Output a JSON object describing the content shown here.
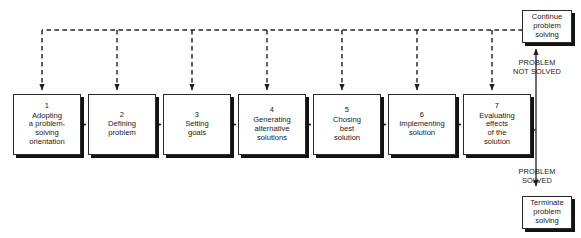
{
  "diagram": {
    "stages": [
      {
        "num": "1",
        "label": "Adopting\na problem-\nsolving\norientation",
        "x": 13
      },
      {
        "num": "2",
        "label": "Defining\nproblem",
        "x": 88
      },
      {
        "num": "3",
        "label": "Setting\ngoals",
        "x": 163
      },
      {
        "num": "4",
        "label": "Generating\nalternative\nsolutions",
        "x": 238
      },
      {
        "num": "5",
        "label": "Chosing\nbest\nsolution",
        "x": 313
      },
      {
        "num": "6",
        "label": "Implementing\nsolution",
        "x": 388
      },
      {
        "num": "7",
        "label": "Evaluating\neffects\nof the\nsolution",
        "x": 463
      }
    ],
    "outcomes": [
      {
        "id": "continue",
        "label": "Continue\nproblem\nsolving",
        "x": 522,
        "y": 10
      },
      {
        "id": "terminate",
        "label": "Terminate\nproblem\nsolving",
        "x": 522,
        "y": 196
      }
    ],
    "edge_labels": [
      {
        "id": "not-solved",
        "text": "PROBLEM\nNOT SOLVED",
        "x": 497,
        "y": 59
      },
      {
        "id": "solved",
        "text": "PROBLEM\nSOLVED",
        "x": 497,
        "y": 168
      }
    ],
    "colors": {
      "stroke": "#2b2b2b",
      "shadow": "#121212",
      "background": "#ffffff",
      "text": "#1a1a1a"
    },
    "feedback_loop": {
      "style": "dashed",
      "description": "Dashed feedback path from Continue problem solving back to every stage"
    }
  }
}
